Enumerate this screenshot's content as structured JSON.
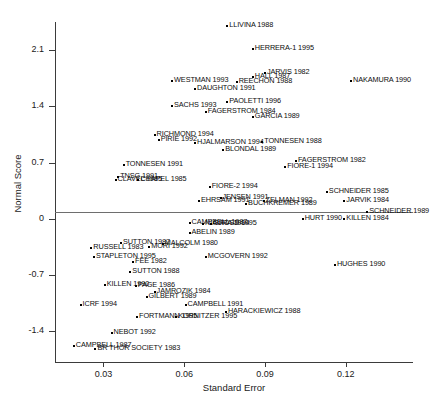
{
  "chart_data": {
    "type": "scatter",
    "title": "",
    "xlabel": "Standard Error",
    "ylabel": "Normal Score",
    "xlim": [
      0.012,
      0.145
    ],
    "ylim": [
      -1.78,
      2.45
    ],
    "xticks": [
      0.03,
      0.06,
      0.09,
      0.12
    ],
    "xticklabels": [
      "0.03",
      "0.06",
      "0.09",
      "0.12"
    ],
    "yticks": [
      2.1,
      1.4,
      0.7,
      0,
      -0.7,
      -1.4
    ],
    "yticklabels": [
      "2.1",
      "1.4",
      "0.7",
      "0",
      "-0.7",
      "-1.4"
    ],
    "grid": false,
    "legend": null,
    "zero_reference_line": 0,
    "points": [
      {
        "label": "LLIVINA 1988",
        "x": 0.076,
        "y": 2.4,
        "align": "right"
      },
      {
        "label": "HERRERA-1 1995",
        "x": 0.0855,
        "y": 2.12,
        "align": "right"
      },
      {
        "label": "JARVIS 1982",
        "x": 0.09,
        "y": 1.82,
        "align": "right"
      },
      {
        "label": "HALL 1987",
        "x": 0.0855,
        "y": 1.76,
        "align": "right"
      },
      {
        "label": "WESTMAN 1993",
        "x": 0.0555,
        "y": 1.72,
        "align": "right"
      },
      {
        "label": "REECHON 1988",
        "x": 0.0795,
        "y": 1.7,
        "align": "right"
      },
      {
        "label": "NAKAMURA 1990",
        "x": 0.122,
        "y": 1.72,
        "align": "right"
      },
      {
        "label": "DAUGHTON 1991",
        "x": 0.064,
        "y": 1.62,
        "align": "right"
      },
      {
        "label": "PAOLETTI 1996",
        "x": 0.076,
        "y": 1.46,
        "align": "right"
      },
      {
        "label": "SACHS 1993",
        "x": 0.0555,
        "y": 1.41,
        "align": "right"
      },
      {
        "label": "FAGERSTROM 1984",
        "x": 0.068,
        "y": 1.33,
        "align": "right"
      },
      {
        "label": "GARCIA 1989",
        "x": 0.0855,
        "y": 1.27,
        "align": "right"
      },
      {
        "label": "RICHMOND 1994",
        "x": 0.049,
        "y": 1.05,
        "align": "right"
      },
      {
        "label": "PIRIE 1992",
        "x": 0.0505,
        "y": 0.98,
        "align": "right"
      },
      {
        "label": "HJALMARSON 1994",
        "x": 0.064,
        "y": 0.95,
        "align": "right"
      },
      {
        "label": "TONNESEN 1988",
        "x": 0.089,
        "y": 0.96,
        "align": "right"
      },
      {
        "label": "BLONDAL 1989",
        "x": 0.0745,
        "y": 0.86,
        "align": "right"
      },
      {
        "label": "FAGERSTROM 1982",
        "x": 0.1015,
        "y": 0.72,
        "align": "right"
      },
      {
        "label": "TONNESEN 1991",
        "x": 0.0375,
        "y": 0.67,
        "align": "right"
      },
      {
        "label": "FIORE-1 1994",
        "x": 0.0975,
        "y": 0.65,
        "align": "right"
      },
      {
        "label": "TNSG 1991",
        "x": 0.0355,
        "y": 0.52,
        "align": "right"
      },
      {
        "label": "CLAVEL 1985",
        "x": 0.0345,
        "y": 0.48,
        "align": "right"
      },
      {
        "label": "CHAPEL 1985",
        "x": 0.043,
        "y": 0.48,
        "align": "right"
      },
      {
        "label": "FIORE-2 1994",
        "x": 0.0695,
        "y": 0.4,
        "align": "right"
      },
      {
        "label": "SCHNEIDER 1985",
        "x": 0.113,
        "y": 0.33,
        "align": "right"
      },
      {
        "label": "JENSEN 1991",
        "x": 0.0735,
        "y": 0.26,
        "align": "right"
      },
      {
        "label": "EHRSAM 1991",
        "x": 0.0655,
        "y": 0.22,
        "align": "right"
      },
      {
        "label": "ZELMAN 1992",
        "x": 0.0895,
        "y": 0.22,
        "align": "right"
      },
      {
        "label": "BUCHKREMER 1989",
        "x": 0.083,
        "y": 0.19,
        "align": "right"
      },
      {
        "label": "JARVIK 1984",
        "x": 0.1195,
        "y": 0.22,
        "align": "right"
      },
      {
        "label": "SCHNEIDER 1989",
        "x": 0.128,
        "y": 0.09,
        "align": "right"
      },
      {
        "label": "HURT 1990",
        "x": 0.104,
        "y": 0.0,
        "align": "right"
      },
      {
        "label": "KILLEN 1984",
        "x": 0.1195,
        "y": 0.0,
        "align": "right"
      },
      {
        "label": "CAMPBELL 1987",
        "x": 0.062,
        "y": -0.05,
        "align": "right"
      },
      {
        "label": "NIAURA 1994",
        "x": 0.067,
        "y": -0.06,
        "align": "right"
      },
      {
        "label": "GROSS 1995",
        "x": 0.07,
        "y": -0.06,
        "align": "right"
      },
      {
        "label": "ABELIN 1989",
        "x": 0.062,
        "y": -0.17,
        "align": "right"
      },
      {
        "label": "MALCOLM 1980",
        "x": 0.052,
        "y": -0.31,
        "align": "right"
      },
      {
        "label": "SUTTON 1987",
        "x": 0.0365,
        "y": -0.3,
        "align": "right"
      },
      {
        "label": "MORI 1992",
        "x": 0.047,
        "y": -0.35,
        "align": "right"
      },
      {
        "label": "RUSSELL 1983",
        "x": 0.0255,
        "y": -0.36,
        "align": "right"
      },
      {
        "label": "STAPLETON 1995",
        "x": 0.0265,
        "y": -0.47,
        "align": "right"
      },
      {
        "label": "MCGOVERN 1992",
        "x": 0.068,
        "y": -0.47,
        "align": "right"
      },
      {
        "label": "FEE 1982",
        "x": 0.041,
        "y": -0.53,
        "align": "right"
      },
      {
        "label": "HUGHES 1990",
        "x": 0.116,
        "y": -0.57,
        "align": "right"
      },
      {
        "label": "SUTTON 1988",
        "x": 0.04,
        "y": -0.66,
        "align": "right"
      },
      {
        "label": "KILLEN 1990",
        "x": 0.0305,
        "y": -0.82,
        "align": "right"
      },
      {
        "label": "PAGE 1986",
        "x": 0.042,
        "y": -0.83,
        "align": "right"
      },
      {
        "label": "JAMROZIK 1984",
        "x": 0.049,
        "y": -0.91,
        "align": "right"
      },
      {
        "label": "GILBERT 1989",
        "x": 0.046,
        "y": -0.97,
        "align": "right"
      },
      {
        "label": "ICRF 1994",
        "x": 0.0215,
        "y": -1.07,
        "align": "right"
      },
      {
        "label": "CAMPBELL 1991",
        "x": 0.0605,
        "y": -1.07,
        "align": "right"
      },
      {
        "label": "HARACKIEWICZ 1988",
        "x": 0.0755,
        "y": -1.16,
        "align": "right"
      },
      {
        "label": "FORTMANN 1995",
        "x": 0.0425,
        "y": -1.22,
        "align": "right"
      },
      {
        "label": "KORNITZER 1995",
        "x": 0.057,
        "y": -1.22,
        "align": "right"
      },
      {
        "label": "NEBOT 1992",
        "x": 0.033,
        "y": -1.42,
        "align": "right"
      },
      {
        "label": "CAMPBELL 1987",
        "x": 0.019,
        "y": -1.58,
        "align": "right"
      },
      {
        "label": "BR THOR SOCIETY 1983",
        "x": 0.027,
        "y": -1.62,
        "align": "right"
      }
    ]
  },
  "axis_color": "#3b3b3b",
  "point_color": "#000000",
  "zero_line_color": "#6e6e6e"
}
